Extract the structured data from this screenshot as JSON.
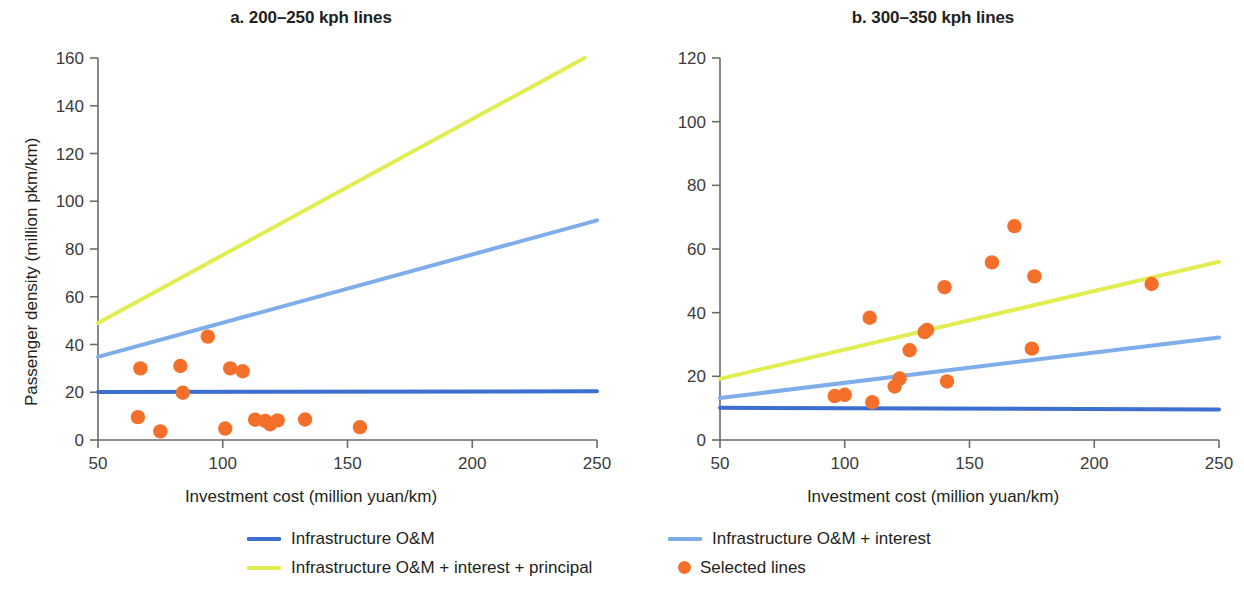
{
  "figure": {
    "background": "#ffffff"
  },
  "colors": {
    "dark_blue": "#3d6fd0",
    "light_blue": "#7fadea",
    "yellow": "#e2ed52",
    "orange": "#f4702a",
    "axis": "#6b6b6b",
    "text": "#231f20"
  },
  "legend": {
    "items": [
      {
        "label": "Infrastructure O&M",
        "marker": "line",
        "color": "#3d6fd0"
      },
      {
        "label": "Infrastructure O&M + interest",
        "marker": "line",
        "color": "#7fadea"
      },
      {
        "label": "Infrastructure O&M + interest + principal",
        "marker": "line",
        "color": "#e2ed52"
      },
      {
        "label": "Selected lines",
        "marker": "dot",
        "color": "#f4702a"
      }
    ]
  },
  "chart_data": [
    {
      "type": "scatter",
      "panel": "a",
      "title": "a. 200–250 kph lines",
      "xlabel": "Investment cost (million yuan/km)",
      "ylabel": "Passenger density (million pkm/km)",
      "xlim": [
        50,
        250
      ],
      "ylim": [
        0,
        160
      ],
      "xticks": [
        50,
        100,
        150,
        200,
        250
      ],
      "yticks": [
        0,
        20,
        40,
        60,
        80,
        100,
        120,
        140,
        160
      ],
      "grid": false,
      "legend_position": "bottom",
      "series": [
        {
          "name": "Infrastructure O&M",
          "kind": "line",
          "color": "#3d6fd0",
          "points": [
            [
              50,
              20.1
            ],
            [
              250,
              20.4
            ]
          ]
        },
        {
          "name": "Infrastructure O&M + interest",
          "kind": "line",
          "color": "#7fadea",
          "points": [
            [
              50,
              34.8
            ],
            [
              250,
              92.0
            ]
          ]
        },
        {
          "name": "Infrastructure O&M + interest + principal",
          "kind": "line",
          "color": "#e2ed52",
          "points": [
            [
              50,
              49.0
            ],
            [
              245,
              160.0
            ]
          ]
        },
        {
          "name": "Selected lines",
          "kind": "scatter",
          "color": "#f4702a",
          "points": [
            [
              67,
              30.0
            ],
            [
              66,
              9.6
            ],
            [
              75,
              3.6
            ],
            [
              83,
              31.0
            ],
            [
              84,
              19.8
            ],
            [
              94,
              43.3
            ],
            [
              103,
              30.0
            ],
            [
              101,
              4.8
            ],
            [
              108,
              28.8
            ],
            [
              113,
              8.5
            ],
            [
              117,
              8.0
            ],
            [
              119,
              6.6
            ],
            [
              122,
              8.2
            ],
            [
              133,
              8.6
            ],
            [
              155,
              5.4
            ]
          ]
        }
      ]
    },
    {
      "type": "scatter",
      "panel": "b",
      "title": "b. 300–350 kph lines",
      "xlabel": "Investment cost (million yuan/km)",
      "ylabel": "Passenger density (million pkm/km)",
      "xlim": [
        50,
        250
      ],
      "ylim": [
        0,
        120
      ],
      "xticks": [
        50,
        100,
        150,
        200,
        250
      ],
      "yticks": [
        0,
        20,
        40,
        60,
        80,
        100,
        120
      ],
      "grid": false,
      "legend_position": "bottom",
      "series": [
        {
          "name": "Infrastructure O&M",
          "kind": "line",
          "color": "#3d6fd0",
          "points": [
            [
              50,
              10.1
            ],
            [
              250,
              9.6
            ]
          ]
        },
        {
          "name": "Infrastructure O&M + interest",
          "kind": "line",
          "color": "#7fadea",
          "points": [
            [
              50,
              13.2
            ],
            [
              250,
              32.2
            ]
          ]
        },
        {
          "name": "Infrastructure O&M + interest + principal",
          "kind": "line",
          "color": "#e2ed52",
          "points": [
            [
              50,
              19.2
            ],
            [
              250,
              56.0
            ]
          ]
        },
        {
          "name": "Selected lines",
          "kind": "scatter",
          "color": "#f4702a",
          "points": [
            [
              96,
              13.8
            ],
            [
              100,
              14.2
            ],
            [
              110,
              38.4
            ],
            [
              111,
              11.9
            ],
            [
              120,
              16.8
            ],
            [
              122,
              19.3
            ],
            [
              126,
              28.2
            ],
            [
              132,
              33.9
            ],
            [
              133,
              34.6
            ],
            [
              141,
              18.4
            ],
            [
              140,
              48.0
            ],
            [
              159,
              55.8
            ],
            [
              168,
              67.2
            ],
            [
              176,
              51.4
            ],
            [
              175,
              28.7
            ],
            [
              223,
              49.0
            ]
          ]
        }
      ]
    }
  ]
}
